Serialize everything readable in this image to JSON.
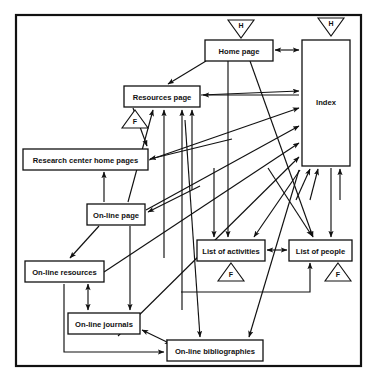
{
  "diagram": {
    "frame": {
      "x": 15,
      "y": 14,
      "width": 347,
      "height": 353,
      "color": "#111111"
    },
    "background_color": "#ffffff",
    "line_color": "#111111",
    "nodes": [
      {
        "id": "home",
        "label": "Home page",
        "x": 205,
        "y": 40,
        "width": 68,
        "height": 21
      },
      {
        "id": "index",
        "label": "Index",
        "x": 302,
        "y": 40,
        "width": 48,
        "height": 126
      },
      {
        "id": "resources",
        "label": "Resources page",
        "x": 124,
        "y": 86,
        "width": 76,
        "height": 21
      },
      {
        "id": "research",
        "label": "Research center home pages",
        "x": 23,
        "y": 149,
        "width": 125,
        "height": 21
      },
      {
        "id": "online",
        "label": "On-line page",
        "x": 87,
        "y": 204,
        "width": 58,
        "height": 21
      },
      {
        "id": "activities",
        "label": "List of activities",
        "x": 197,
        "y": 240,
        "width": 68,
        "height": 21
      },
      {
        "id": "people",
        "label": "List of people",
        "x": 289,
        "y": 240,
        "width": 63,
        "height": 21
      },
      {
        "id": "onres",
        "label": "On-line resources",
        "x": 25,
        "y": 261,
        "width": 79,
        "height": 21
      },
      {
        "id": "onjour",
        "label": "On-line journals",
        "x": 68,
        "y": 313,
        "width": 72,
        "height": 21
      },
      {
        "id": "onbib",
        "label": "On-line bibliographies",
        "x": 167,
        "y": 340,
        "width": 96,
        "height": 21
      }
    ],
    "markers": [
      {
        "id": "h-home",
        "label": "H",
        "shape": "triangle-down",
        "x": 228,
        "y": 20,
        "width": 26,
        "height": 18
      },
      {
        "id": "h-index",
        "label": "H",
        "shape": "triangle-down",
        "x": 318,
        "y": 18,
        "width": 26,
        "height": 18
      },
      {
        "id": "f-resources",
        "label": "F",
        "shape": "triangle-up",
        "x": 122,
        "y": 110,
        "width": 26,
        "height": 18
      },
      {
        "id": "f-activities",
        "label": "F",
        "shape": "triangle-up",
        "x": 218,
        "y": 263,
        "width": 26,
        "height": 18
      },
      {
        "id": "f-people",
        "label": "F",
        "shape": "triangle-up",
        "x": 325,
        "y": 263,
        "width": 26,
        "height": 18
      }
    ],
    "legend": {
      "h_meaning": "H",
      "f_meaning": "F"
    },
    "edges": [
      {
        "from": "home",
        "to": "index",
        "arrow": "both"
      },
      {
        "from": "home",
        "to": "resources",
        "arrow": "to"
      },
      {
        "from": "home",
        "to": "activities",
        "arrow": "to"
      },
      {
        "from": "home",
        "to": "people",
        "arrow": "to"
      },
      {
        "from": "resources",
        "to": "index",
        "arrow": "to"
      },
      {
        "from": "resources",
        "to": "research",
        "arrow": "to"
      },
      {
        "from": "research",
        "to": "index",
        "arrow": "to"
      },
      {
        "from": "online",
        "to": "resources",
        "arrow": "to"
      },
      {
        "from": "online",
        "to": "index",
        "arrow": "to"
      },
      {
        "from": "online",
        "to": "onres",
        "arrow": "to"
      },
      {
        "from": "online",
        "to": "onjour",
        "arrow": "to"
      },
      {
        "from": "onres",
        "to": "resources",
        "arrow": "to"
      },
      {
        "from": "onres",
        "to": "index",
        "arrow": "to"
      },
      {
        "from": "onres",
        "to": "onjour",
        "arrow": "both"
      },
      {
        "from": "onjour",
        "to": "resources",
        "arrow": "to"
      },
      {
        "from": "onjour",
        "to": "index",
        "arrow": "to"
      },
      {
        "from": "onjour",
        "to": "onbib",
        "arrow": "both"
      },
      {
        "from": "onbib",
        "to": "online",
        "arrow": "to"
      },
      {
        "from": "onbib",
        "to": "index",
        "arrow": "to"
      },
      {
        "from": "onbib",
        "to": "onres",
        "arrow": "to"
      },
      {
        "from": "activities",
        "to": "people",
        "arrow": "both"
      },
      {
        "from": "activities",
        "to": "index",
        "arrow": "to"
      },
      {
        "from": "people",
        "to": "index",
        "arrow": "to"
      },
      {
        "from": "people",
        "to": "onbib",
        "arrow": "to"
      },
      {
        "from": "onbib",
        "to": "people",
        "arrow": "to"
      },
      {
        "from": "research",
        "to": "online",
        "arrow": "to"
      }
    ]
  }
}
